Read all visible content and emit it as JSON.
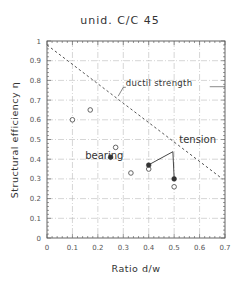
{
  "chart_data": {
    "type": "scatter",
    "title": "unid. C/C 45",
    "xlabel": "Ratio d/w",
    "ylabel": "Structural efficiency η",
    "xlim": [
      0,
      0.7
    ],
    "ylim": [
      0,
      1
    ],
    "xticks": [
      "0",
      "0.1",
      "0.2",
      "0.3",
      "0.4",
      "0.5",
      "0.6",
      "0.7"
    ],
    "yticks": [
      "0",
      "0.1",
      "0.2",
      "0.3",
      "0.4",
      "0.5",
      "0.6",
      "0.7",
      "0.8",
      "0.9",
      "1"
    ],
    "grid": true,
    "series": [
      {
        "name": "open circles",
        "marker": "open-circle",
        "points": [
          {
            "x": 0.1,
            "y": 0.6
          },
          {
            "x": 0.17,
            "y": 0.65
          },
          {
            "x": 0.27,
            "y": 0.46
          },
          {
            "x": 0.33,
            "y": 0.33
          },
          {
            "x": 0.4,
            "y": 0.35
          },
          {
            "x": 0.5,
            "y": 0.26
          }
        ]
      },
      {
        "name": "filled circles",
        "marker": "filled-circle",
        "points": [
          {
            "x": 0.25,
            "y": 0.41
          },
          {
            "x": 0.4,
            "y": 0.37
          },
          {
            "x": 0.5,
            "y": 0.3
          }
        ]
      },
      {
        "name": "ductil strength",
        "type": "dashed-line",
        "points": [
          {
            "x": 0.0,
            "y": 0.98
          },
          {
            "x": 0.69,
            "y": 0.3
          }
        ]
      }
    ],
    "annotations": [
      {
        "text": "ductil strength",
        "x": 0.31,
        "y": 0.77
      },
      {
        "text": "bearing",
        "x": 0.15,
        "y": 0.4
      },
      {
        "text": "tension",
        "x": 0.52,
        "y": 0.48
      }
    ]
  }
}
